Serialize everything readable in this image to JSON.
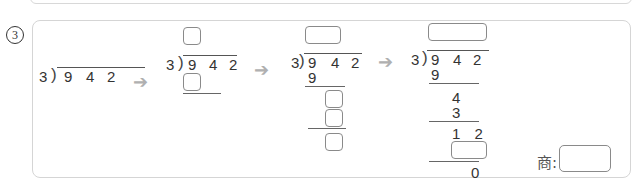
{
  "question": {
    "number": "3"
  },
  "steps": [
    {
      "divisor": "3",
      "dividend": [
        "9",
        "4",
        "2"
      ]
    },
    {
      "divisor": "3",
      "dividend": [
        "9",
        "4",
        "2"
      ]
    },
    {
      "divisor": "3",
      "dividend": [
        "9",
        "4",
        "2"
      ],
      "work": [
        "9"
      ]
    },
    {
      "divisor": "3",
      "dividend": [
        "9",
        "4",
        "2"
      ],
      "work": [
        "9",
        "4",
        "3",
        "1 2",
        "0"
      ]
    }
  ],
  "arrow_glyph": "➔",
  "answer": {
    "label": "商:"
  }
}
